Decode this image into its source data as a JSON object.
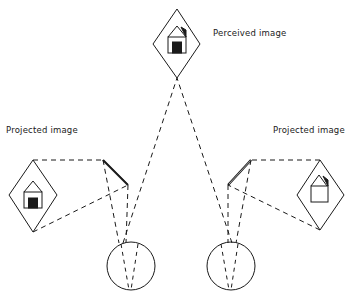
{
  "labels": {
    "perceived": "Perceived image",
    "projected_left": "Projected image",
    "projected_right": "Projected image"
  },
  "colors": {
    "stroke": "#1a1a1a",
    "background": "#ffffff"
  }
}
